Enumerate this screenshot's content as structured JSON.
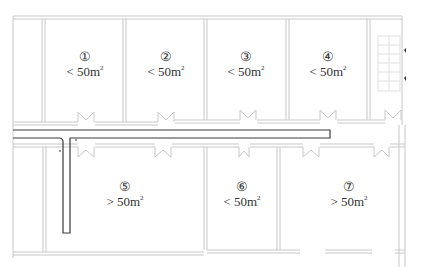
{
  "diagram": {
    "type": "floor-plan",
    "colors": {
      "wall": "#c8c8c8",
      "pipe": "#3a3a3a",
      "text": "#333333",
      "stair": "#e0e0e0"
    },
    "rooms": [
      {
        "id": "room-1",
        "number": "①",
        "comparator": "<",
        "area": "50m",
        "unit_sup": "2",
        "area_text": "< 50m²"
      },
      {
        "id": "room-2",
        "number": "②",
        "comparator": "<",
        "area": "50m",
        "unit_sup": "2",
        "area_text": "< 50m²"
      },
      {
        "id": "room-3",
        "number": "③",
        "comparator": "<",
        "area": "50m",
        "unit_sup": "2",
        "area_text": "< 50m²"
      },
      {
        "id": "room-4",
        "number": "④",
        "comparator": "<",
        "area": "50m",
        "unit_sup": "2",
        "area_text": "< 50m²"
      },
      {
        "id": "room-5",
        "number": "⑤",
        "comparator": ">",
        "area": "50m",
        "unit_sup": "2",
        "area_text": "> 50m²"
      },
      {
        "id": "room-6",
        "number": "⑥",
        "comparator": "<",
        "area": "50m",
        "unit_sup": "2",
        "area_text": "< 50m²"
      },
      {
        "id": "room-7",
        "number": "⑦",
        "comparator": ">",
        "area": "50m",
        "unit_sup": "2",
        "area_text": "> 50m²"
      }
    ],
    "elements": [
      "corridor",
      "L-shaped pipe along corridor",
      "stairwell (top right)",
      "double doors to corridor"
    ]
  }
}
